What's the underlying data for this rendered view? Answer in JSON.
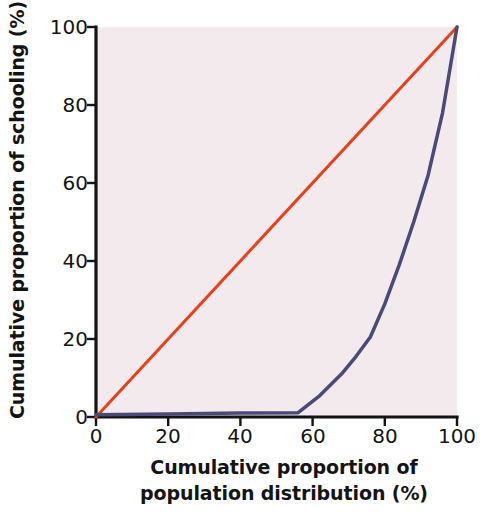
{
  "chart_data": {
    "type": "line",
    "title": "",
    "xlabel": "Cumulative proportion of population distribution (%)",
    "xlabel_line1": "Cumulative proportion of",
    "xlabel_line2": "population distribution (%)",
    "ylabel": "Cumulative proportion of schooling (%)",
    "xlim": [
      0,
      100
    ],
    "ylim": [
      0,
      100
    ],
    "xticks": [
      0,
      20,
      40,
      60,
      80,
      100
    ],
    "yticks": [
      0,
      20,
      40,
      60,
      80,
      100
    ],
    "xtick_labels": [
      "0",
      "20",
      "40",
      "60",
      "80",
      "100"
    ],
    "ytick_labels": [
      "0",
      "20",
      "40",
      "60",
      "80",
      "100"
    ],
    "grid": false,
    "legend": "none",
    "plot_background_color": "#f2eaec",
    "axis_color": "#141414",
    "series": [
      {
        "name": "Line of perfect equality",
        "color": "#e8401a",
        "linewidth": 3,
        "x": [
          0,
          100
        ],
        "y": [
          0,
          100
        ]
      },
      {
        "name": "Lorenz curve",
        "color": "#4a4a78",
        "linewidth": 3.5,
        "x": [
          0,
          20,
          40,
          56,
          62,
          68,
          72,
          76,
          80,
          84,
          88,
          92,
          96,
          100
        ],
        "y": [
          0.6,
          0.8,
          1.0,
          1.1,
          5.5,
          11,
          15.5,
          20.5,
          29,
          39,
          50,
          62,
          78,
          100
        ]
      }
    ]
  }
}
